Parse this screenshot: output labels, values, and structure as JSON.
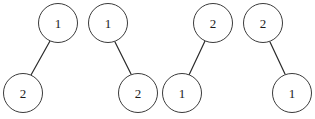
{
  "figure": {
    "type": "graph-diagram",
    "width": 315,
    "height": 119,
    "background_color": "#ffffff",
    "node": {
      "radius": 20,
      "border_color": "#3a3a3a",
      "border_width": 1.2,
      "fill_color": "#ffffff",
      "label_color": "#1c1c1c",
      "label_font_size": 13
    },
    "edge": {
      "color": "#2b2b2b",
      "width": 1.2
    }
  },
  "graphs": [
    {
      "id": "graph-1",
      "nodes": [
        {
          "id": "g1-n1",
          "label": "1",
          "cx": 58,
          "cy": 23
        },
        {
          "id": "g1-n2",
          "label": "2",
          "cx": 23,
          "cy": 93
        }
      ],
      "edges": [
        {
          "from": "g1-n1",
          "to": "g1-n2",
          "x1": 50,
          "y1": 41,
          "x2": 31,
          "y2": 75
        }
      ]
    },
    {
      "id": "graph-2",
      "nodes": [
        {
          "id": "g2-n1",
          "label": "1",
          "cx": 108,
          "cy": 23
        },
        {
          "id": "g2-n2",
          "label": "2",
          "cx": 138,
          "cy": 93
        }
      ],
      "edges": [
        {
          "from": "g2-n1",
          "to": "g2-n2",
          "x1": 115,
          "y1": 42,
          "x2": 131,
          "y2": 74
        }
      ]
    },
    {
      "id": "graph-3",
      "nodes": [
        {
          "id": "g3-n1",
          "label": "2",
          "cx": 213,
          "cy": 23
        },
        {
          "id": "g3-n2",
          "label": "1",
          "cx": 182,
          "cy": 93
        }
      ],
      "edges": [
        {
          "from": "g3-n1",
          "to": "g3-n2",
          "x1": 205,
          "y1": 41,
          "x2": 189,
          "y2": 75
        }
      ]
    },
    {
      "id": "graph-4",
      "nodes": [
        {
          "id": "g4-n1",
          "label": "2",
          "cx": 263,
          "cy": 23
        },
        {
          "id": "g4-n2",
          "label": "1",
          "cx": 292,
          "cy": 93
        }
      ],
      "edges": [
        {
          "from": "g4-n1",
          "to": "g4-n2",
          "x1": 270,
          "y1": 42,
          "x2": 285,
          "y2": 74
        }
      ]
    }
  ]
}
